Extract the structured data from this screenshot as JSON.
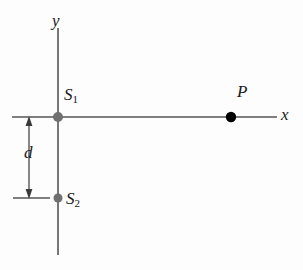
{
  "figure": {
    "type": "physics-diagram",
    "background_color": "#fdfdfd",
    "line_color": "#555555",
    "source_dot_color": "#707070",
    "point_dot_color": "#000000",
    "label_color": "#1a1a1a"
  },
  "axes": {
    "y_axis": {
      "label": "y",
      "x": 58,
      "y_start": 28,
      "y_end": 255
    },
    "x_axis": {
      "label": "x",
      "y": 117,
      "x_start": 12,
      "x_end": 277
    }
  },
  "points": [
    {
      "id": "S1",
      "label": "S",
      "subscript": "1",
      "x": 58,
      "y": 117,
      "radius": 5,
      "color": "#707070"
    },
    {
      "id": "S2",
      "label": "S",
      "subscript": "2",
      "x": 58,
      "y": 198,
      "radius": 4.5,
      "color": "#707070"
    },
    {
      "id": "P",
      "label": "P",
      "subscript": "",
      "x": 231,
      "y": 117,
      "radius": 5,
      "color": "#000000"
    }
  ],
  "dimension": {
    "label": "d",
    "arrow_x": 29,
    "y_top": 117,
    "y_bottom": 198,
    "value": 81,
    "extension_tick": {
      "y": 198,
      "x_start": 13,
      "x_end": 50
    }
  }
}
